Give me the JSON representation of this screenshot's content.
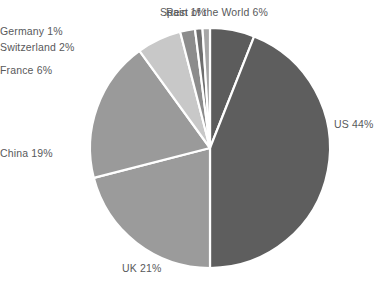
{
  "chart_data": {
    "type": "pie",
    "title": "",
    "subtitle": "",
    "xlabel": "",
    "ylabel": "",
    "legend_position": "none",
    "grid": false,
    "units": "percent",
    "start_angle_deg": 0,
    "direction": "clockwise",
    "background_color": "#ffffff",
    "separator_color": "#ffffff",
    "label_color": "#58595b",
    "categories": [
      "Rest of the World",
      "US",
      "UK",
      "China",
      "France",
      "Switzerland",
      "Germany",
      "Spain"
    ],
    "values": [
      6,
      44,
      21,
      19,
      6,
      2,
      1,
      1
    ],
    "labels": [
      "Rest of the World 6%",
      "US 44%",
      "UK 21%",
      "China 19%",
      "France 6%",
      "Switzerland 2%",
      "Germany 1%",
      "Spain 1%"
    ],
    "colors": [
      "#5c5c5c",
      "#5e5e5e",
      "#9b9b9b",
      "#9a9a9a",
      "#c8c8c8",
      "#8c8c8c",
      "#6f6f6f",
      "#a6a6a6"
    ]
  },
  "slices": {
    "rest_of_world": {
      "label": "Rest of the World 6%",
      "name": "Rest of the World",
      "value": 6,
      "color": "#5c5c5c"
    },
    "us": {
      "label": "US 44%",
      "name": "US",
      "value": 44,
      "color": "#5e5e5e"
    },
    "uk": {
      "label": "UK 21%",
      "name": "UK",
      "value": 21,
      "color": "#9b9b9b"
    },
    "china": {
      "label": "China 19%",
      "name": "China",
      "value": 19,
      "color": "#9a9a9a"
    },
    "france": {
      "label": "France 6%",
      "name": "France",
      "value": 6,
      "color": "#c8c8c8"
    },
    "switzerland": {
      "label": "Switzerland 2%",
      "name": "Switzerland",
      "value": 2,
      "color": "#8c8c8c"
    },
    "germany": {
      "label": "Germany 1%",
      "name": "Germany",
      "value": 1,
      "color": "#6f6f6f"
    },
    "spain": {
      "label": "Spain 1%",
      "name": "Spain",
      "value": 1,
      "color": "#a6a6a6"
    }
  }
}
